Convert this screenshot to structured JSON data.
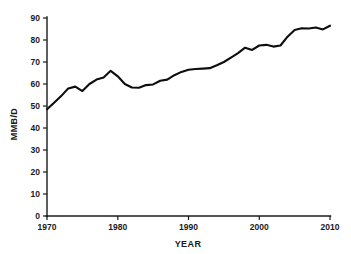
{
  "chart_data": {
    "type": "line",
    "title": "",
    "xlabel": "YEAR",
    "ylabel": "MMB/D",
    "xlim": [
      1970,
      2010
    ],
    "ylim": [
      0,
      90
    ],
    "xticks": [
      1970,
      1980,
      1990,
      2000,
      2010
    ],
    "yticks": [
      0,
      10,
      20,
      30,
      40,
      50,
      60,
      70,
      80,
      90
    ],
    "grid": false,
    "legend": null,
    "series": [
      {
        "name": "World Oil Production",
        "color": "#0d0d0d",
        "x": [
          1970,
          1971,
          1972,
          1973,
          1974,
          1975,
          1976,
          1977,
          1978,
          1979,
          1980,
          1981,
          1982,
          1983,
          1984,
          1985,
          1986,
          1987,
          1988,
          1989,
          1990,
          1991,
          1992,
          1993,
          1994,
          1995,
          1996,
          1997,
          1998,
          1999,
          2000,
          2001,
          2002,
          2003,
          2004,
          2005,
          2006,
          2007,
          2008,
          2009,
          2010
        ],
        "values": [
          48.5,
          51.5,
          54.5,
          58.0,
          58.8,
          56.8,
          60.0,
          62.0,
          63.0,
          66.0,
          63.5,
          60.0,
          58.4,
          58.3,
          59.5,
          59.8,
          61.5,
          62.0,
          64.0,
          65.5,
          66.5,
          66.8,
          67.0,
          67.2,
          68.5,
          70.0,
          72.0,
          74.0,
          76.5,
          75.5,
          77.5,
          77.8,
          77.0,
          77.5,
          81.5,
          84.5,
          85.3,
          85.2,
          85.7,
          84.8,
          86.5
        ]
      }
    ]
  },
  "axes": {
    "x_tick_labels": [
      "1970",
      "1980",
      "1990",
      "2000",
      "2010"
    ],
    "y_tick_labels": [
      "0",
      "10",
      "20",
      "30",
      "40",
      "50",
      "60",
      "70",
      "80",
      "90"
    ],
    "x_axis_title": "YEAR",
    "y_axis_title": "MMB/D"
  }
}
